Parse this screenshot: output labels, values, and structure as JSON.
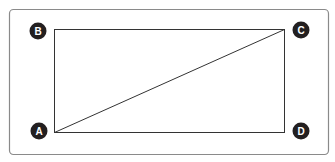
{
  "diagram": {
    "type": "rectangle-with-diagonal",
    "frame_color": "#8a8a8a",
    "line_color": "#333333",
    "marker_color": "#231f20",
    "points": [
      {
        "label": "A",
        "x": 39,
        "y": 131
      },
      {
        "label": "B",
        "x": 38,
        "y": 31
      },
      {
        "label": "C",
        "x": 301,
        "y": 30
      },
      {
        "label": "D",
        "x": 301,
        "y": 131
      }
    ],
    "diagonal": {
      "from": "A",
      "to": "C"
    }
  }
}
